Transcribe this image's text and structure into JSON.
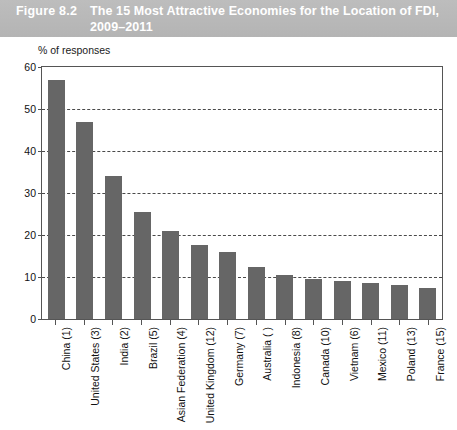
{
  "header": {
    "figure_number": "Figure 8.2",
    "title": "The 15 Most Attractive Economies for the Location of FDI, 2009–2011"
  },
  "axis_caption": "% of responses",
  "colors": {
    "header_background": "#b8b8b8",
    "header_text": "#ffffff",
    "bar_fill": "#666666",
    "gridline": "#4a4a4a",
    "axis": "#555555",
    "plot_background": "#ffffff"
  },
  "chart_data": {
    "type": "bar",
    "title": "The 15 Most Attractive Economies for the Location of FDI, 2009–2011",
    "xlabel": "",
    "ylabel": "% of responses",
    "ylim": [
      0,
      60
    ],
    "yticks": [
      0,
      10,
      20,
      30,
      40,
      50,
      60
    ],
    "ytick_labels": [
      "0",
      "10",
      "20",
      "30",
      "40",
      "50",
      "60"
    ],
    "grid": true,
    "grid_axis": "y",
    "legend": false,
    "categories": [
      "China (1)",
      "United States (3)",
      "India (2)",
      "Brazil (5)",
      "Asian Federation (4)",
      "United Kingdom (12)",
      "Germany (7)",
      "Australia ( )",
      "Indonesia (8)",
      "Canada (10)",
      "Vietnam (6)",
      "Mexico (11)",
      "Poland (13)",
      "France (15)"
    ],
    "values": [
      56.9,
      46.8,
      34.1,
      25.4,
      20.9,
      17.6,
      16.0,
      12.4,
      10.4,
      9.5,
      9.1,
      8.6,
      8.2,
      7.3
    ]
  }
}
